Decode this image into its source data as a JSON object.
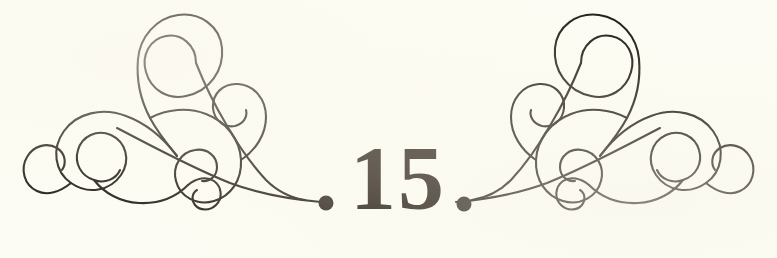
{
  "page": {
    "kind": "book-page-ornament",
    "page_number": "15",
    "background_color": "#fdfcf4",
    "ink_color": "#1a1410"
  },
  "ornament": {
    "left": {
      "name": "left-flourish",
      "description": "calligraphic scrollwork flourish with interlaced spirals",
      "terminal_dot": {
        "cx": 326,
        "cy": 203,
        "r": 7.5
      }
    },
    "right": {
      "name": "right-flourish",
      "description": "mirrored calligraphic scrollwork flourish with interlaced spirals",
      "terminal_dot": {
        "cx": 464,
        "cy": 204,
        "r": 7.5
      }
    }
  }
}
